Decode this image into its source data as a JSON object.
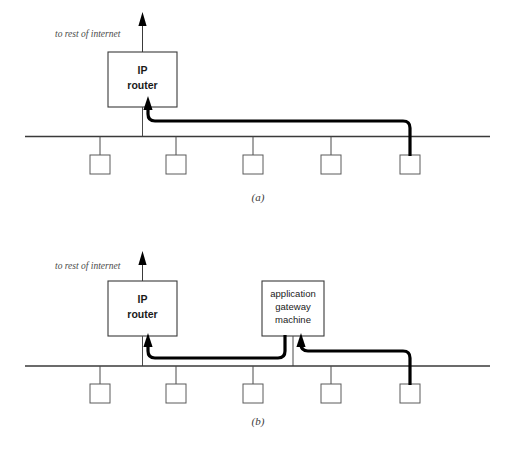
{
  "figure": {
    "title_label": "",
    "panels": [
      {
        "id": "a",
        "caption": "(a)",
        "annotation": "to rest of internet",
        "devices": [
          {
            "name": "ip-router",
            "lines": [
              "IP",
              "router"
            ]
          }
        ],
        "host_count": 5,
        "uplink_arrow": "up-arrow-to-internet",
        "cable_note": "thick screened-subnet cable from last host to IP router"
      },
      {
        "id": "b",
        "caption": "(b)",
        "annotation": "to rest of internet",
        "devices": [
          {
            "name": "ip-router",
            "lines": [
              "IP",
              "router"
            ]
          },
          {
            "name": "application-gateway-machine",
            "lines": [
              "application",
              "gateway",
              "machine"
            ]
          }
        ],
        "host_count": 5,
        "uplink_arrow": "up-arrow-to-internet",
        "cable_note": "thick cable from last host to gateway, then gateway to IP router"
      }
    ]
  },
  "colors": {
    "background": "#ffffff",
    "bus": "#3a3a3a",
    "cable": "#000000",
    "box_stroke": "#3a3a3a",
    "host_stroke": "#5a5a5a",
    "annotation_text": "#4a4a4a",
    "caption_text": "#3a3a3a",
    "label_text": "#1a1a1a"
  }
}
